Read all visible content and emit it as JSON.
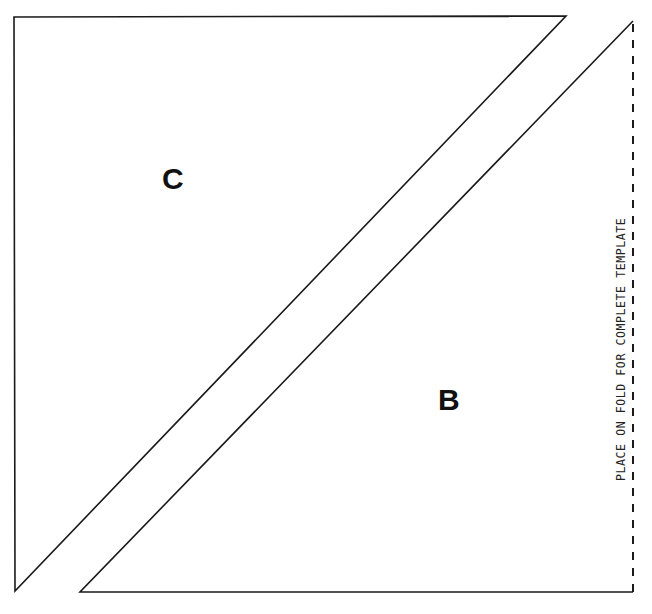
{
  "diagram": {
    "type": "quilt-template",
    "pieces": [
      {
        "label": "C",
        "shape": "right-triangle",
        "points": [
          [
            14,
            17
          ],
          [
            566,
            16
          ],
          [
            15,
            591
          ]
        ]
      },
      {
        "label": "B",
        "shape": "right-triangle",
        "points": [
          [
            632,
            20
          ],
          [
            633,
            592
          ],
          [
            80,
            592
          ]
        ]
      }
    ],
    "fold_line": {
      "x": 633,
      "y1": 22,
      "y2": 592,
      "style": "dashed"
    },
    "fold_instruction": "PLACE ON FOLD FOR COMPLETE TEMPLATE",
    "colors": {
      "line": "#1a1a1a",
      "background": "#ffffff",
      "text": "#111111"
    }
  }
}
